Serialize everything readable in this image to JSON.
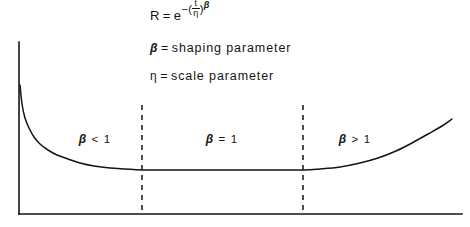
{
  "figure": {
    "type": "bathtub-curve-diagram",
    "background_color": "#ffffff",
    "ink_color": "#141414"
  },
  "formula": {
    "lhs": "R",
    "equals": "=",
    "base": "e",
    "exponent_sign": "−",
    "paren_open": "(",
    "numerator": "t",
    "denominator": "η",
    "paren_close": ")",
    "exponent_power": "β",
    "plain_text": "R = e^-(t/η)^β"
  },
  "definitions": [
    {
      "symbol": "β",
      "equals": "=",
      "text": "shaping  parameter"
    },
    {
      "symbol": "η",
      "equals": "=",
      "text": "scale  parameter"
    }
  ],
  "regions": [
    {
      "id": "left",
      "symbol": "β",
      "operator": "<",
      "value": "1",
      "label": "β < 1"
    },
    {
      "id": "mid",
      "symbol": "β",
      "operator": "=",
      "value": "1",
      "label": "β = 1"
    },
    {
      "id": "right",
      "symbol": "β",
      "operator": ">",
      "value": "1",
      "label": "β > 1"
    }
  ],
  "chart_data": {
    "type": "line",
    "title": "",
    "subtitle": "",
    "xlabel": "",
    "ylabel": "",
    "grid": false,
    "legend": null,
    "axes": {
      "y_axis": {
        "x": 19,
        "y_top": 42,
        "y_bottom": 214,
        "color": "#141414",
        "width": 1.6
      },
      "x_axis": {
        "y": 214,
        "x_left": 19,
        "x_right": 462,
        "color": "#141414",
        "width": 1.6
      },
      "xlim": [
        0,
        1
      ],
      "ylim": [
        0,
        1
      ],
      "tick_labels_x": [],
      "tick_labels_y": []
    },
    "series": [
      {
        "name": "failure-rate",
        "comment": "Bathtub curve: decreasing infant-mortality, flat useful-life, increasing wear-out.",
        "points_px": [
          [
            20,
            85
          ],
          [
            22,
            104
          ],
          [
            25,
            118
          ],
          [
            29,
            128
          ],
          [
            34,
            137
          ],
          [
            40,
            144
          ],
          [
            48,
            150
          ],
          [
            57,
            155
          ],
          [
            68,
            159
          ],
          [
            80,
            163
          ],
          [
            94,
            166
          ],
          [
            110,
            168
          ],
          [
            126,
            169
          ],
          [
            142,
            170
          ],
          [
            180,
            170
          ],
          [
            220,
            170
          ],
          [
            260,
            170
          ],
          [
            303,
            170
          ],
          [
            320,
            169
          ],
          [
            340,
            167
          ],
          [
            360,
            163
          ],
          [
            378,
            158
          ],
          [
            396,
            151
          ],
          [
            412,
            143
          ],
          [
            428,
            134
          ],
          [
            442,
            126
          ],
          [
            452,
            119
          ]
        ]
      }
    ],
    "dividers": [
      {
        "id": "divider-left",
        "x": 142,
        "y_top": 105,
        "y_bottom": 214,
        "style": "dashed"
      },
      {
        "id": "divider-right",
        "x": 303,
        "y_top": 105,
        "y_bottom": 214,
        "style": "dashed"
      }
    ],
    "annotations": [
      {
        "id": "region-left",
        "text": "β < 1",
        "x": 95,
        "y": 139
      },
      {
        "id": "region-mid",
        "text": "β = 1",
        "x": 222,
        "y": 139
      },
      {
        "id": "region-right",
        "text": "β > 1",
        "x": 355,
        "y": 139
      },
      {
        "id": "formula",
        "text": "R = e^-(t/η)^β",
        "x": 150,
        "y": 20
      },
      {
        "id": "def-beta",
        "text": "β = shaping parameter",
        "x": 150,
        "y": 60
      },
      {
        "id": "def-eta",
        "text": "η = scale parameter",
        "x": 150,
        "y": 82
      }
    ]
  }
}
